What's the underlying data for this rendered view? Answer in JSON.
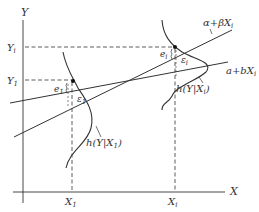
{
  "diagram": {
    "axes": {
      "x_label": "X",
      "y_label": "Y"
    },
    "x_ticks": [
      {
        "base": "X",
        "sub": "1"
      },
      {
        "base": "X",
        "sub": "i"
      }
    ],
    "y_ticks": [
      {
        "base": "Y",
        "sub": "i"
      },
      {
        "base": "Y",
        "sub": "1"
      }
    ],
    "lines": {
      "population": {
        "label": "α+βX",
        "sub": "i"
      },
      "sample": {
        "label": "a+bX",
        "sub": "i"
      }
    },
    "densities": [
      {
        "label": "h(Y|X",
        "sub": "1",
        "close": ")"
      },
      {
        "label": "h(Y|X",
        "sub": "i",
        "close": ")"
      }
    ],
    "errors": [
      {
        "base": "e",
        "sub": "1"
      },
      {
        "base": "ε",
        "sub": "1"
      },
      {
        "base": "e",
        "sub": "i"
      },
      {
        "base": "ε",
        "sub": "i"
      }
    ],
    "colors": {
      "ink": "#333333",
      "background": "#ffffff"
    }
  }
}
